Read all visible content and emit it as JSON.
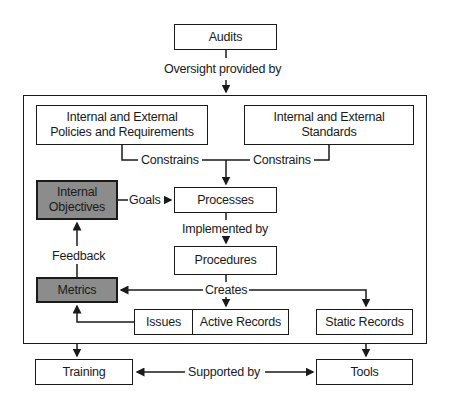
{
  "nodes": {
    "audits": "Audits",
    "policies": "Internal and External\nPolicies and Requirements",
    "policies_line1": "Internal and External",
    "policies_line2": "Policies and Requirements",
    "standards_line1": "Internal and External",
    "standards_line2": "Standards",
    "internal_objectives_line1": "Internal",
    "internal_objectives_line2": "Objectives",
    "processes": "Processes",
    "procedures": "Procedures",
    "metrics": "Metrics",
    "issues": "Issues",
    "active_records": "Active Records",
    "static_records": "Static Records",
    "training": "Training",
    "tools": "Tools"
  },
  "edges": {
    "oversight": "Oversight provided by",
    "constrains_left": "Constrains",
    "constrains_right": "Constrains",
    "goals": "Goals",
    "implemented_by": "Implemented by",
    "feedback": "Feedback",
    "creates": "Creates",
    "supported_by": "Supported by"
  },
  "colors": {
    "highlight_fill": "#8c8c8c",
    "stroke": "#1a1a1a",
    "background": "#ffffff"
  }
}
